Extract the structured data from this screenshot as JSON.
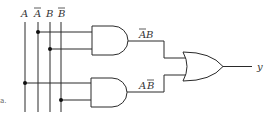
{
  "figure": {
    "type": "logic-circuit",
    "fragment_label": "a."
  },
  "inputs": [
    {
      "label": "A",
      "negated": false
    },
    {
      "label": "A",
      "negated": true
    },
    {
      "label": "B",
      "negated": false
    },
    {
      "label": "B",
      "negated": true
    }
  ],
  "gates": [
    {
      "id": "and-upper",
      "type": "AND",
      "inputs": [
        "A̅",
        "B"
      ],
      "output_label_main": "AB",
      "output_label": "A̅B"
    },
    {
      "id": "and-lower",
      "type": "AND",
      "inputs": [
        "A",
        "B̅"
      ],
      "output_label_main": "AB",
      "output_label": "AB̅"
    },
    {
      "id": "or-out",
      "type": "OR",
      "inputs": [
        "A̅B",
        "AB̅"
      ],
      "output_label": "y"
    }
  ],
  "labels": {
    "in_A": "A",
    "in_Abar": "A",
    "in_B": "B",
    "in_Bbar": "B",
    "upper_A": "A",
    "upper_B": "B",
    "lower_A": "A",
    "lower_B": "B",
    "output": "y",
    "fragment": "a."
  },
  "colors": {
    "line": "#2a2a2a",
    "text": "#333333",
    "background": "#ffffff"
  }
}
